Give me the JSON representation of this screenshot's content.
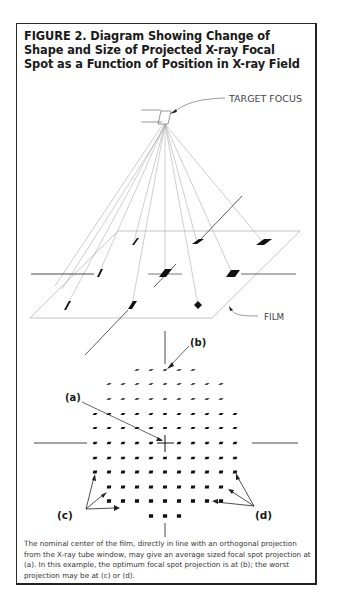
{
  "figure": {
    "title": "FIGURE 2. Diagram Showing Change of Shape and Size of Projected X-ray Focal Spot as a Function of Position in X-ray Field",
    "caption": "The nominal center of the film, directly in line with an orthogonal projection from the X-ray tube window, may give an average sized focal spot projection at (a). In this example, the optimum focal spot projection is at (b); the worst projection may be at (c) or (d).",
    "labels": {
      "target_focus": "TARGET FOCUS",
      "film": "FILM",
      "a": "(a)",
      "b": "(b)",
      "c": "(c)",
      "d": "(d)"
    },
    "colors": {
      "ink": "#1a1a1a",
      "ray": "#9a9a9a",
      "frame": "#2a2a2a"
    }
  },
  "perspective_view": {
    "focus_point": [
      165,
      124
    ],
    "film_plane_corners": [
      [
        118,
        231
      ],
      [
        300,
        231
      ],
      [
        212,
        318
      ],
      [
        30,
        318
      ]
    ],
    "spots": [
      {
        "x": 134,
        "y": 241,
        "w": 3,
        "h": 8
      },
      {
        "x": 197,
        "y": 242,
        "w": 10,
        "h": 5
      },
      {
        "x": 263,
        "y": 242,
        "w": 14,
        "h": 6
      },
      {
        "x": 99,
        "y": 273,
        "w": 3,
        "h": 9
      },
      {
        "x": 165,
        "y": 273,
        "w": 10,
        "h": 7
      },
      {
        "x": 232,
        "y": 273,
        "w": 13,
        "h": 7
      },
      {
        "x": 67,
        "y": 305,
        "w": 4,
        "h": 10
      },
      {
        "x": 132,
        "y": 305,
        "w": 7,
        "h": 9
      },
      {
        "x": 198,
        "y": 305,
        "w": 8,
        "h": 8
      }
    ]
  },
  "grid_view": {
    "center": [
      165,
      443
    ],
    "column_spacing": 14,
    "rows": [
      {
        "y": 370,
        "count": 5
      },
      {
        "y": 384,
        "count": 9
      },
      {
        "y": 399,
        "count": 9
      },
      {
        "y": 414,
        "count": 11
      },
      {
        "y": 428,
        "count": 11
      },
      {
        "y": 443,
        "count": 11
      },
      {
        "y": 458,
        "count": 11
      },
      {
        "y": 472,
        "count": 11
      },
      {
        "y": 487,
        "count": 9
      },
      {
        "y": 501,
        "count": 9
      },
      {
        "y": 516,
        "count": 3
      }
    ]
  }
}
